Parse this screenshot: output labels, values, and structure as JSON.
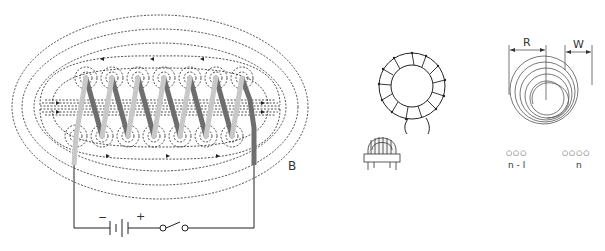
{
  "figures": {
    "solenoid": {
      "field_label": "B",
      "battery_minus": "−",
      "battery_plus": "+",
      "turns": 7
    },
    "toroid": {
      "windings": 14
    },
    "spiral_coil": {
      "radius_label": "R",
      "width_label": "W",
      "left_turn_label": "n - l",
      "right_turn_label": "n",
      "left_dots": "○○○",
      "right_dots": "○○○○"
    }
  },
  "colors": {
    "line": "#222222",
    "wire_light": "#c8c8c8",
    "wire_dark": "#6e6e6e",
    "background": "#ffffff"
  }
}
